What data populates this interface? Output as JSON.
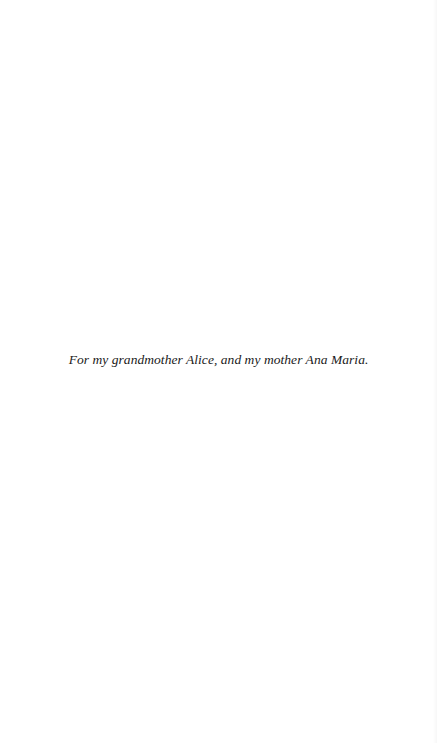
{
  "page": {
    "background": "#ffffff",
    "text_color": "#1a1a1a"
  },
  "dedication": {
    "text": "For my grandmother Alice, and my mother Ana Maria."
  }
}
